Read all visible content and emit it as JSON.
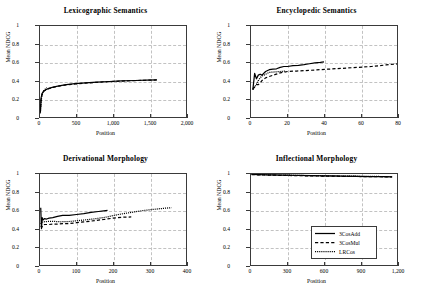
{
  "figure": {
    "xlabel": "Position",
    "ylabel": "Mean NDCG"
  },
  "legend": {
    "entries": [
      {
        "label": "3CosAdd",
        "style": "solid"
      },
      {
        "label": "3CosMul",
        "style": "dashed"
      },
      {
        "label": "LRCos",
        "style": "dotted"
      }
    ]
  },
  "chart_data": [
    {
      "type": "line",
      "title": "Lexicographic Semantics",
      "xlabel": "Position",
      "ylabel": "Mean NDCG",
      "xlim": [
        0,
        2000
      ],
      "ylim": [
        0,
        1
      ],
      "xticks": [
        0,
        500,
        1000,
        1500,
        2000
      ],
      "xticklabels": [
        "0",
        "500",
        "1,000",
        "1,500",
        "2,000"
      ],
      "yticks": [
        0,
        0.2,
        0.4,
        0.6,
        0.8,
        1
      ],
      "yticklabels": [
        "0",
        "0.2",
        "0.4",
        "0.6",
        "0.8",
        "1"
      ],
      "grid": true,
      "legend": false,
      "series": [
        {
          "name": "3CosAdd",
          "style": "solid",
          "x": [
            5,
            15,
            30,
            50,
            80,
            120,
            180,
            260,
            360,
            480,
            620,
            780,
            950,
            1120,
            1300,
            1460,
            1600
          ],
          "y": [
            0.06,
            0.21,
            0.26,
            0.285,
            0.3,
            0.315,
            0.328,
            0.343,
            0.355,
            0.366,
            0.375,
            0.383,
            0.39,
            0.396,
            0.401,
            0.405,
            0.408
          ]
        },
        {
          "name": "3CosMul",
          "style": "dashed",
          "x": [
            5,
            15,
            30,
            50,
            80,
            120,
            180,
            260,
            360,
            480,
            620,
            780,
            950,
            1120,
            1300,
            1460,
            1600
          ],
          "y": [
            0.05,
            0.2,
            0.255,
            0.282,
            0.298,
            0.312,
            0.325,
            0.34,
            0.352,
            0.363,
            0.373,
            0.381,
            0.389,
            0.395,
            0.4,
            0.404,
            0.407
          ]
        },
        {
          "name": "LRCos",
          "style": "dotted",
          "x": [
            5,
            12,
            22,
            35,
            50,
            65,
            80,
            95
          ],
          "y": [
            0.04,
            0.14,
            0.22,
            0.26,
            0.285,
            0.3,
            0.312,
            0.322
          ]
        }
      ]
    },
    {
      "type": "line",
      "title": "Encyclopedic Semantics",
      "xlabel": "Position",
      "ylabel": "Mean NDCG",
      "xlim": [
        0,
        80
      ],
      "ylim": [
        0,
        1
      ],
      "xticks": [
        0,
        20,
        40,
        60,
        80
      ],
      "xticklabels": [
        "0",
        "20",
        "40",
        "60",
        "80"
      ],
      "yticks": [
        0,
        0.2,
        0.4,
        0.6,
        0.8,
        1
      ],
      "yticklabels": [
        "0",
        "0.2",
        "0.4",
        "0.6",
        "0.8",
        "1"
      ],
      "grid": true,
      "legend": false,
      "series": [
        {
          "name": "3CosAdd",
          "style": "solid",
          "x": [
            1,
            2,
            3,
            4,
            5,
            6,
            8,
            10,
            12,
            14,
            16,
            18,
            20,
            23,
            26,
            29,
            32,
            35,
            38,
            40
          ],
          "y": [
            0.3,
            0.48,
            0.42,
            0.46,
            0.47,
            0.46,
            0.5,
            0.52,
            0.525,
            0.53,
            0.545,
            0.555,
            0.555,
            0.565,
            0.568,
            0.575,
            0.585,
            0.595,
            0.6,
            0.605
          ]
        },
        {
          "name": "3CosMul",
          "style": "dashed",
          "x": [
            1,
            2,
            3,
            4,
            5,
            6,
            8,
            10,
            13,
            16,
            20,
            25,
            30,
            36,
            42,
            50,
            58,
            66,
            74,
            81
          ],
          "y": [
            0.31,
            0.33,
            0.355,
            0.355,
            0.375,
            0.4,
            0.43,
            0.445,
            0.465,
            0.485,
            0.5,
            0.505,
            0.51,
            0.518,
            0.525,
            0.535,
            0.545,
            0.555,
            0.572,
            0.585
          ]
        },
        {
          "name": "LRCos",
          "style": "dotted",
          "x": [
            1,
            2,
            3,
            4,
            5,
            6,
            8,
            10,
            13,
            16,
            19
          ],
          "y": [
            0.3,
            0.33,
            0.36,
            0.4,
            0.43,
            0.45,
            0.47,
            0.49,
            0.495,
            0.5,
            0.505
          ]
        }
      ]
    },
    {
      "type": "line",
      "title": "Derivational Morphology",
      "xlabel": "Position",
      "ylabel": "Mean NDCG",
      "xlim": [
        0,
        400
      ],
      "ylim": [
        0,
        1
      ],
      "xticks": [
        0,
        100,
        200,
        300,
        400
      ],
      "xticklabels": [
        "0",
        "100",
        "200",
        "300",
        "400"
      ],
      "yticks": [
        0,
        0.2,
        0.4,
        0.6,
        0.8,
        1
      ],
      "yticklabels": [
        "0",
        "0.2",
        "0.4",
        "0.6",
        "0.8",
        "1"
      ],
      "grid": true,
      "legend": false,
      "series": [
        {
          "name": "3CosAdd",
          "style": "solid",
          "x": [
            2,
            4,
            6,
            8,
            12,
            18,
            25,
            35,
            48,
            62,
            80,
            100,
            120,
            140,
            160,
            175,
            185
          ],
          "y": [
            0.63,
            0.4,
            0.52,
            0.495,
            0.51,
            0.505,
            0.515,
            0.52,
            0.535,
            0.545,
            0.545,
            0.555,
            0.565,
            0.578,
            0.588,
            0.595,
            0.6
          ]
        },
        {
          "name": "3CosMul",
          "style": "dashed",
          "x": [
            2,
            5,
            8,
            12,
            18,
            25,
            35,
            48,
            62,
            80,
            100,
            125,
            150,
            175,
            200,
            225,
            250
          ],
          "y": [
            0.43,
            0.415,
            0.44,
            0.445,
            0.445,
            0.445,
            0.45,
            0.45,
            0.455,
            0.455,
            0.465,
            0.475,
            0.488,
            0.5,
            0.515,
            0.525,
            0.528
          ]
        },
        {
          "name": "LRCos",
          "style": "dotted",
          "x": [
            2,
            5,
            10,
            20,
            35,
            55,
            80,
            110,
            145,
            180,
            215,
            250,
            285,
            320,
            345,
            360
          ],
          "y": [
            0.45,
            0.47,
            0.475,
            0.478,
            0.48,
            0.475,
            0.478,
            0.49,
            0.505,
            0.525,
            0.555,
            0.578,
            0.6,
            0.615,
            0.625,
            0.63
          ]
        }
      ]
    },
    {
      "type": "line",
      "title": "Inflectional Morphology",
      "xlabel": "Position",
      "ylabel": "Mean NDCG",
      "xlim": [
        0,
        1200
      ],
      "ylim": [
        0,
        1
      ],
      "xticks": [
        0,
        300,
        600,
        900,
        1200
      ],
      "xticklabels": [
        "0",
        "300",
        "600",
        "900",
        "1,200"
      ],
      "yticks": [
        0,
        0.2,
        0.4,
        0.6,
        0.8,
        1
      ],
      "yticklabels": [
        "0",
        "0.2",
        "0.4",
        "0.6",
        "0.8",
        "1"
      ],
      "grid": true,
      "legend": true,
      "series": [
        {
          "name": "3CosAdd",
          "style": "solid",
          "x": [
            5,
            60,
            150,
            260,
            380,
            500,
            620,
            740,
            860,
            980,
            1090,
            1160
          ],
          "y": [
            0.995,
            0.993,
            0.99,
            0.987,
            0.984,
            0.981,
            0.979,
            0.976,
            0.974,
            0.972,
            0.97,
            0.969
          ]
        },
        {
          "name": "3CosMul",
          "style": "dashed",
          "x": [
            5,
            60,
            150,
            260,
            380,
            500,
            620,
            740,
            860,
            980,
            1090,
            1160
          ],
          "y": [
            0.993,
            0.991,
            0.988,
            0.985,
            0.982,
            0.979,
            0.977,
            0.975,
            0.973,
            0.971,
            0.969,
            0.968
          ]
        },
        {
          "name": "LRCos",
          "style": "dotted",
          "x": [
            5,
            60,
            150,
            260,
            380,
            500,
            620,
            740,
            860,
            980,
            1090,
            1160
          ],
          "y": [
            0.996,
            0.994,
            0.991,
            0.988,
            0.985,
            0.982,
            0.98,
            0.978,
            0.976,
            0.974,
            0.972,
            0.971
          ]
        }
      ]
    }
  ]
}
